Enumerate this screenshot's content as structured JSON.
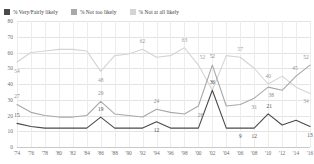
{
  "legend": {
    "items": [
      {
        "label": "% Very/Fairly likely",
        "color": "#4a4a4a",
        "name": "legend-very-fairly-likely"
      },
      {
        "label": "% Not too likely",
        "color": "#a8a8a8",
        "name": "legend-not-too-likely"
      },
      {
        "label": "% Not at all likely",
        "color": "#d4d4d4",
        "name": "legend-not-at-all-likely"
      }
    ]
  },
  "chart_data": {
    "type": "line",
    "title": "",
    "xlabel": "",
    "ylabel": "",
    "ylim": [
      0,
      80
    ],
    "yticks": [
      80,
      70,
      60,
      50,
      40,
      30,
      20,
      10,
      0
    ],
    "grid": true,
    "legend_position": "top-left",
    "x": [
      "'74",
      "'76",
      "'78",
      "'80",
      "'82",
      "'84",
      "'86",
      "'88",
      "'90",
      "'92",
      "'94",
      "'96",
      "'98",
      "'00",
      "'02",
      "'04",
      "'06",
      "'08",
      "'10",
      "'12",
      "'14",
      "'16"
    ],
    "series": [
      {
        "name": "% Not at all likely",
        "color": "#d4d4d4",
        "values": [
          54,
          60,
          61,
          62,
          62,
          61,
          48,
          58,
          59,
          62,
          57,
          58,
          63,
          52,
          36,
          58,
          57,
          50,
          40,
          45,
          38,
          34
        ],
        "labels": [
          {
            "i": 0,
            "text": "54",
            "dx": 0,
            "dy": 9
          },
          {
            "i": 6,
            "text": "48",
            "dx": 0,
            "dy": 9
          },
          {
            "i": 9,
            "text": "62",
            "dx": 0,
            "dy": -8
          },
          {
            "i": 12,
            "text": "63",
            "dx": 0,
            "dy": -8
          },
          {
            "i": 13,
            "text": "52",
            "dx": 4,
            "dy": -8
          },
          {
            "i": 16,
            "text": "57",
            "dx": 0,
            "dy": -8
          },
          {
            "i": 18,
            "text": "40",
            "dx": 0,
            "dy": -8
          },
          {
            "i": 21,
            "text": "34",
            "dx": -4,
            "dy": 8
          }
        ]
      },
      {
        "name": "% Not too likely",
        "color": "#a8a8a8",
        "values": [
          27,
          22,
          20,
          19,
          19,
          20,
          29,
          21,
          20,
          19,
          24,
          22,
          21,
          26,
          52,
          26,
          27,
          31,
          38,
          36,
          45,
          52
        ],
        "labels": [
          {
            "i": 0,
            "text": "27",
            "dx": 0,
            "dy": -8
          },
          {
            "i": 6,
            "text": "29",
            "dx": 0,
            "dy": -8
          },
          {
            "i": 10,
            "text": "24",
            "dx": 0,
            "dy": -8
          },
          {
            "i": 13,
            "text": "26",
            "dx": 2,
            "dy": 9
          },
          {
            "i": 14,
            "text": "52",
            "dx": 0,
            "dy": -9
          },
          {
            "i": 17,
            "text": "31",
            "dx": 0,
            "dy": 9
          },
          {
            "i": 18,
            "text": "38",
            "dx": 3,
            "dy": 8
          },
          {
            "i": 20,
            "text": "45",
            "dx": -1,
            "dy": -8
          },
          {
            "i": 21,
            "text": "52",
            "dx": -4,
            "dy": -8
          }
        ]
      },
      {
        "name": "% Very/Fairly likely",
        "color": "#4a4a4a",
        "values": [
          15,
          13,
          12,
          12,
          12,
          12,
          19,
          12,
          12,
          12,
          16,
          12,
          12,
          12,
          36,
          12,
          12,
          12,
          21,
          14,
          17,
          13
        ],
        "labels": [
          {
            "i": 0,
            "text": "15",
            "dx": 0,
            "dy": -8
          },
          {
            "i": 6,
            "text": "19",
            "dx": 0,
            "dy": -8
          },
          {
            "i": 10,
            "text": "12",
            "dx": 0,
            "dy": 8
          },
          {
            "i": 14,
            "text": "36",
            "dx": 0,
            "dy": -8
          },
          {
            "i": 16,
            "text": "9",
            "dx": 0,
            "dy": 8
          },
          {
            "i": 17,
            "text": "12",
            "dx": 0,
            "dy": 8
          },
          {
            "i": 18,
            "text": "21",
            "dx": 1,
            "dy": -8
          },
          {
            "i": 21,
            "text": "13",
            "dx": 0,
            "dy": 8
          }
        ]
      }
    ]
  }
}
